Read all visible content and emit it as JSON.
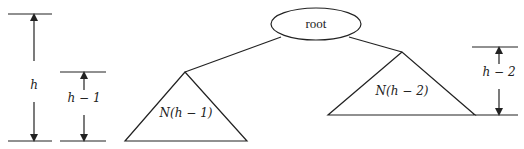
{
  "diagram": {
    "type": "avl-tree-height-recurrence",
    "root": {
      "label": "root"
    },
    "left_subtree": {
      "label": "N(h − 1)"
    },
    "right_subtree": {
      "label": "N(h − 2)"
    },
    "height_markers": [
      {
        "id": "total",
        "label": "h"
      },
      {
        "id": "left",
        "label": "h − 1"
      },
      {
        "id": "right",
        "label": "h − 2"
      }
    ],
    "colors": {
      "stroke": "#222222",
      "background": "#ffffff"
    }
  }
}
